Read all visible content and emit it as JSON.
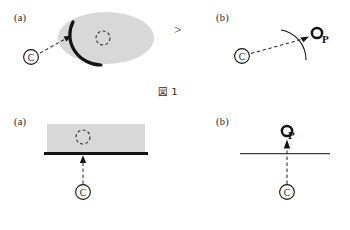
{
  "document": {
    "type": "linguistics-schema-figure",
    "background_color": "#ffffff",
    "ink_color": "#141414",
    "shade_color": "#d8d8d8"
  },
  "figures": [
    {
      "id": "figure-1",
      "caption": "図 1",
      "separator": ">",
      "panels": [
        {
          "id": "fig1-panel-a",
          "label": "(a)",
          "region_shape": "ellipse",
          "region_fill": "#d8d8d8",
          "profiled_boundary": "thick-arc-left",
          "p_marker": "dashed-circle",
          "p_label": "P",
          "c_label": "C",
          "connector": "dashed-arrow"
        },
        {
          "id": "fig1-panel-b",
          "label": "(b)",
          "region_shape": "thin-arc",
          "region_fill": "none",
          "profiled_boundary": "none",
          "p_marker": "ring",
          "p_label": "P",
          "c_label": "C",
          "connector": "dashed-arrow"
        }
      ]
    },
    {
      "id": "figure-2",
      "caption": "図 2",
      "caption_source": "（山梨 2000: 100)",
      "separator": ">",
      "panels": [
        {
          "id": "fig2-panel-a",
          "label": "(a)",
          "region_shape": "rectangle",
          "region_fill": "#d8d8d8",
          "profiled_boundary": "thick-line-bottom",
          "p_marker": "dashed-circle",
          "p_label": "P",
          "c_label": "C",
          "connector": "dashed-arrow"
        },
        {
          "id": "fig2-panel-b",
          "label": "(b)",
          "region_shape": "thin-horizontal-line",
          "region_fill": "none",
          "profiled_boundary": "none",
          "p_marker": "ring",
          "p_label": "P",
          "c_label": "C",
          "connector": "dashed-arrow"
        }
      ]
    }
  ]
}
